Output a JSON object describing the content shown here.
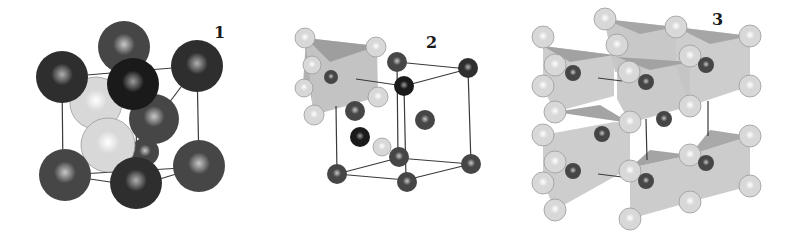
{
  "figure": {
    "panels": [
      {
        "label": "1",
        "description": "Cubic unit cell with large dark spheres at corners and face positions, two light spheres inside",
        "x": 0,
        "width": 270,
        "label_x": 214,
        "label_y": 23,
        "edges": [
          [
            62,
            77,
            197,
            66
          ],
          [
            62,
            77,
            63,
            175
          ],
          [
            197,
            66,
            199,
            167
          ],
          [
            63,
            175,
            199,
            167
          ],
          [
            88,
            102,
            162,
            112
          ],
          [
            136,
            115,
            137,
            186
          ],
          [
            63,
            175,
            137,
            186
          ],
          [
            199,
            167,
            137,
            186
          ],
          [
            88,
            102,
            62,
            77
          ],
          [
            162,
            112,
            197,
            66
          ]
        ],
        "atoms": [
          {
            "cx": 124,
            "cy": 47,
            "r": 26,
            "tone": "mid"
          },
          {
            "cx": 96,
            "cy": 103,
            "r": 26,
            "tone": "light"
          },
          {
            "cx": 62,
            "cy": 77,
            "r": 26,
            "tone": "dark"
          },
          {
            "cx": 197,
            "cy": 66,
            "r": 26,
            "tone": "dark"
          },
          {
            "cx": 154,
            "cy": 119,
            "r": 25,
            "tone": "mid"
          },
          {
            "cx": 145,
            "cy": 152,
            "r": 14,
            "tone": "mid"
          },
          {
            "cx": 108,
            "cy": 145,
            "r": 27,
            "tone": "light"
          },
          {
            "cx": 133,
            "cy": 84,
            "r": 26,
            "tone": "darkest"
          },
          {
            "cx": 65,
            "cy": 175,
            "r": 26,
            "tone": "mid"
          },
          {
            "cx": 199,
            "cy": 166,
            "r": 26,
            "tone": "mid"
          },
          {
            "cx": 136,
            "cy": 183,
            "r": 26,
            "tone": "dark"
          }
        ],
        "polyhedra": []
      },
      {
        "label": "2",
        "description": "Hexagonal-type cell with small dark cations, light anions forming a shaded trigonal prism",
        "x": 270,
        "width": 250,
        "label_x": 156,
        "label_y": 33,
        "edges": [
          [
            127,
            62,
            198,
            69
          ],
          [
            134,
            86,
            198,
            69
          ],
          [
            127,
            62,
            128,
            158
          ],
          [
            134,
            86,
            136,
            180
          ],
          [
            198,
            69,
            201,
            164
          ],
          [
            67,
            174,
            128,
            158
          ],
          [
            67,
            174,
            136,
            180
          ],
          [
            128,
            158,
            201,
            164
          ],
          [
            136,
            180,
            201,
            164
          ],
          [
            66,
            106,
            67,
            174
          ],
          [
            86,
            79,
            134,
            86
          ]
        ],
        "polyhedra": [
          {
            "points": "36,38 107,46 108,97 44,115",
            "fill": "#bdbdbd"
          },
          {
            "points": "36,38 107,46 60,62",
            "fill": "#9a9a9a"
          },
          {
            "points": "36,38 44,115 40,90 33,85",
            "fill": "#a8a8a8"
          }
        ],
        "atoms": [
          {
            "cx": 35,
            "cy": 38,
            "r": 10,
            "tone": "light"
          },
          {
            "cx": 106,
            "cy": 47,
            "r": 10,
            "tone": "light"
          },
          {
            "cx": 42,
            "cy": 65,
            "r": 9,
            "tone": "light"
          },
          {
            "cx": 61,
            "cy": 77,
            "r": 7,
            "tone": "mid"
          },
          {
            "cx": 34,
            "cy": 88,
            "r": 9,
            "tone": "light"
          },
          {
            "cx": 108,
            "cy": 97,
            "r": 10,
            "tone": "light"
          },
          {
            "cx": 44,
            "cy": 115,
            "r": 10,
            "tone": "light"
          },
          {
            "cx": 127,
            "cy": 62,
            "r": 10,
            "tone": "mid"
          },
          {
            "cx": 198,
            "cy": 68,
            "r": 10,
            "tone": "dark"
          },
          {
            "cx": 134,
            "cy": 86,
            "r": 10,
            "tone": "darkest"
          },
          {
            "cx": 85,
            "cy": 111,
            "r": 10,
            "tone": "mid"
          },
          {
            "cx": 155,
            "cy": 120,
            "r": 10,
            "tone": "mid"
          },
          {
            "cx": 90,
            "cy": 137,
            "r": 10,
            "tone": "darkest"
          },
          {
            "cx": 112,
            "cy": 147,
            "r": 9,
            "tone": "light"
          },
          {
            "cx": 129,
            "cy": 157,
            "r": 10,
            "tone": "mid"
          },
          {
            "cx": 67,
            "cy": 174,
            "r": 10,
            "tone": "mid"
          },
          {
            "cx": 201,
            "cy": 164,
            "r": 10,
            "tone": "mid"
          },
          {
            "cx": 137,
            "cy": 182,
            "r": 10,
            "tone": "mid"
          }
        ]
      },
      {
        "label": "3",
        "description": "Extended framework of face-sharing trigonal prisms (light grey) with light anions at vertices and cations inside",
        "x": 510,
        "width": 290,
        "label_x": 202,
        "label_y": 10,
        "edges": [
          [
            88,
            78,
            112,
            81
          ],
          [
            88,
            174,
            112,
            177
          ],
          [
            136,
            119,
            137,
            160
          ],
          [
            198,
            101,
            198,
            136
          ]
        ],
        "polyhedra": [
          {
            "points": "33,46 104,55 104,96 45,112 33,88",
            "fill": "#c8c8c8"
          },
          {
            "points": "94,19 166,27 166,66 105,72",
            "fill": "#c2c2c2"
          },
          {
            "points": "166,27 240,36 240,86 180,106 166,66",
            "fill": "#c8c8c8"
          },
          {
            "points": "107,57 180,62 180,106 120,123 107,99",
            "fill": "#c4c4c4"
          },
          {
            "points": "33,135 104,122 120,123 120,168 45,210 33,183",
            "fill": "#c8c8c8"
          },
          {
            "points": "120,168 180,155 240,136 240,186 180,202 120,219",
            "fill": "#c6c6c6"
          },
          {
            "points": "33,46 104,55 60,62",
            "fill": "#9d9d9d"
          },
          {
            "points": "94,19 166,27 130,34",
            "fill": "#a2a2a2"
          },
          {
            "points": "166,27 240,36 200,44",
            "fill": "#a2a2a2"
          },
          {
            "points": "107,57 180,62 140,70",
            "fill": "#9d9d9d"
          },
          {
            "points": "45,112 120,123 90,105",
            "fill": "#9a9a9a"
          },
          {
            "points": "120,168 180,155 140,150",
            "fill": "#9a9a9a"
          },
          {
            "points": "180,155 240,136 200,130",
            "fill": "#a0a0a0"
          }
        ],
        "atoms": [
          {
            "cx": 95,
            "cy": 19,
            "r": 11,
            "tone": "light"
          },
          {
            "cx": 166,
            "cy": 27,
            "r": 11,
            "tone": "light"
          },
          {
            "cx": 33,
            "cy": 37,
            "r": 11,
            "tone": "light"
          },
          {
            "cx": 240,
            "cy": 36,
            "r": 11,
            "tone": "light"
          },
          {
            "cx": 107,
            "cy": 45,
            "r": 11,
            "tone": "light"
          },
          {
            "cx": 180,
            "cy": 56,
            "r": 11,
            "tone": "light"
          },
          {
            "cx": 45,
            "cy": 65,
            "r": 11,
            "tone": "light"
          },
          {
            "cx": 63,
            "cy": 73,
            "r": 8,
            "tone": "mid"
          },
          {
            "cx": 196,
            "cy": 65,
            "r": 8,
            "tone": "mid"
          },
          {
            "cx": 119,
            "cy": 72,
            "r": 11,
            "tone": "light"
          },
          {
            "cx": 136,
            "cy": 82,
            "r": 8,
            "tone": "mid"
          },
          {
            "cx": 33,
            "cy": 86,
            "r": 11,
            "tone": "light"
          },
          {
            "cx": 240,
            "cy": 86,
            "r": 11,
            "tone": "light"
          },
          {
            "cx": 180,
            "cy": 106,
            "r": 11,
            "tone": "light"
          },
          {
            "cx": 45,
            "cy": 112,
            "r": 11,
            "tone": "light"
          },
          {
            "cx": 120,
            "cy": 122,
            "r": 11,
            "tone": "light"
          },
          {
            "cx": 154,
            "cy": 119,
            "r": 8,
            "tone": "mid"
          },
          {
            "cx": 92,
            "cy": 134,
            "r": 8,
            "tone": "mid"
          },
          {
            "cx": 33,
            "cy": 135,
            "r": 11,
            "tone": "light"
          },
          {
            "cx": 240,
            "cy": 136,
            "r": 11,
            "tone": "light"
          },
          {
            "cx": 45,
            "cy": 162,
            "r": 11,
            "tone": "light"
          },
          {
            "cx": 180,
            "cy": 155,
            "r": 11,
            "tone": "light"
          },
          {
            "cx": 63,
            "cy": 171,
            "r": 8,
            "tone": "mid"
          },
          {
            "cx": 196,
            "cy": 163,
            "r": 8,
            "tone": "mid"
          },
          {
            "cx": 120,
            "cy": 171,
            "r": 11,
            "tone": "light"
          },
          {
            "cx": 136,
            "cy": 181,
            "r": 8,
            "tone": "mid"
          },
          {
            "cx": 33,
            "cy": 183,
            "r": 11,
            "tone": "light"
          },
          {
            "cx": 240,
            "cy": 186,
            "r": 11,
            "tone": "light"
          },
          {
            "cx": 180,
            "cy": 202,
            "r": 11,
            "tone": "light"
          },
          {
            "cx": 45,
            "cy": 210,
            "r": 11,
            "tone": "light"
          },
          {
            "cx": 120,
            "cy": 219,
            "r": 11,
            "tone": "light"
          }
        ]
      }
    ],
    "tones": {
      "darkest": {
        "base": "#1a1a1a",
        "hi": "#9a9a9a"
      },
      "dark": {
        "base": "#2e2e2e",
        "hi": "#b0b0b0"
      },
      "mid": {
        "base": "#464646",
        "hi": "#c8c8c8"
      },
      "light": {
        "base": "#d8d8d8",
        "hi": "#ffffff"
      }
    },
    "edge_color": "#3a3a3a"
  }
}
